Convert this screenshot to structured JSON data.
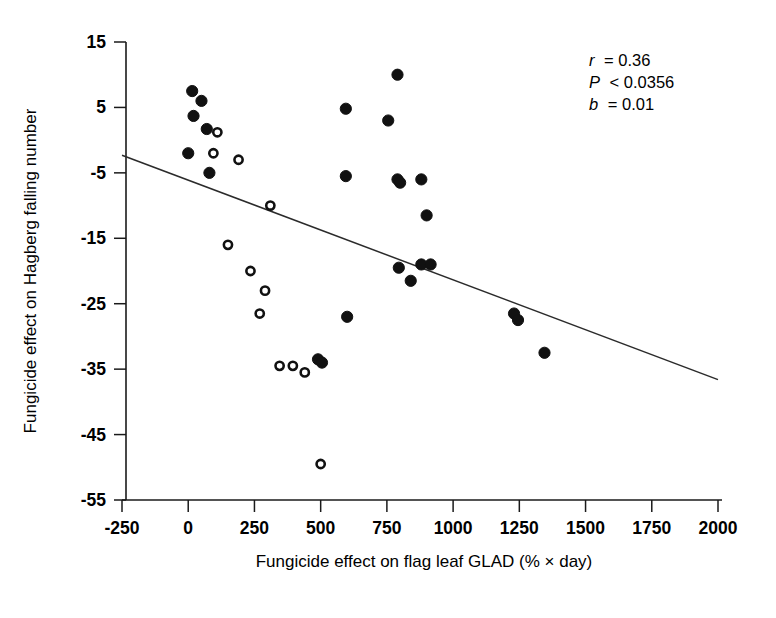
{
  "chart_data": {
    "type": "scatter",
    "title": "",
    "xlabel": "Fungicide effect on flag leaf GLAD (% × day)",
    "ylabel": "Fungicide effect on Hagberg falling number",
    "xlim": [
      -250,
      2000
    ],
    "ylim": [
      -55,
      15
    ],
    "xticks": [
      -250,
      0,
      250,
      500,
      750,
      1000,
      1250,
      1500,
      1750,
      2000
    ],
    "xtick_labels": [
      "-250",
      "0",
      "250",
      "500",
      "750",
      "1000",
      "1250",
      "1500",
      "1750",
      "2000"
    ],
    "yticks": [
      15,
      5,
      -5,
      -15,
      -25,
      -35,
      -45,
      -55
    ],
    "ytick_labels": [
      "15",
      "5",
      "-5",
      "-15",
      "-25",
      "-35",
      "-45",
      "-55"
    ],
    "grid": false,
    "legend": null,
    "annotations": {
      "r_label": "r",
      "r_text": "= 0.36",
      "p_label": "P",
      "p_text": "< 0.0356",
      "b_label": "b",
      "b_text": "= 0.01",
      "full_text": "r = 0.36 ; P < 0.0356 ; b = 0.01"
    },
    "trend_line": {
      "style": "solid",
      "color": "#2b2b2b",
      "x_start": -250,
      "y_start": -2.3,
      "x_end": 2000,
      "y_end": -36.6,
      "slope": 0.01,
      "note": "fitted regression line, b = 0.01 (negative trend as drawn)"
    },
    "series": [
      {
        "name": "filled-circles",
        "marker": "filled-circle",
        "color": "#111111",
        "points": [
          [
            15,
            7.5
          ],
          [
            50,
            6.0
          ],
          [
            20,
            3.7
          ],
          [
            70,
            1.7
          ],
          [
            0,
            -2.0
          ],
          [
            80,
            -5.0
          ],
          [
            790,
            10.0
          ],
          [
            595,
            4.8
          ],
          [
            755,
            3.0
          ],
          [
            595,
            -5.5
          ],
          [
            790,
            -6.0
          ],
          [
            800,
            -6.5
          ],
          [
            880,
            -6.0
          ],
          [
            900,
            -11.5
          ],
          [
            795,
            -19.5
          ],
          [
            880,
            -19.0
          ],
          [
            915,
            -19.0
          ],
          [
            840,
            -21.5
          ],
          [
            600,
            -27.0
          ],
          [
            490,
            -33.5
          ],
          [
            505,
            -34.0
          ],
          [
            1230,
            -26.5
          ],
          [
            1245,
            -27.5
          ],
          [
            1345,
            -32.5
          ]
        ]
      },
      {
        "name": "open-circles",
        "marker": "open-circle",
        "color": "#111111",
        "points": [
          [
            110,
            1.2
          ],
          [
            95,
            -2.0
          ],
          [
            190,
            -3.0
          ],
          [
            310,
            -10.0
          ],
          [
            150,
            -16.0
          ],
          [
            235,
            -20.0
          ],
          [
            290,
            -23.0
          ],
          [
            270,
            -26.5
          ],
          [
            345,
            -34.5
          ],
          [
            395,
            -34.5
          ],
          [
            440,
            -35.5
          ],
          [
            500,
            -49.5
          ]
        ]
      }
    ]
  },
  "axes": {
    "x_axis_name": "x-axis",
    "y_axis_name": "y-axis"
  }
}
